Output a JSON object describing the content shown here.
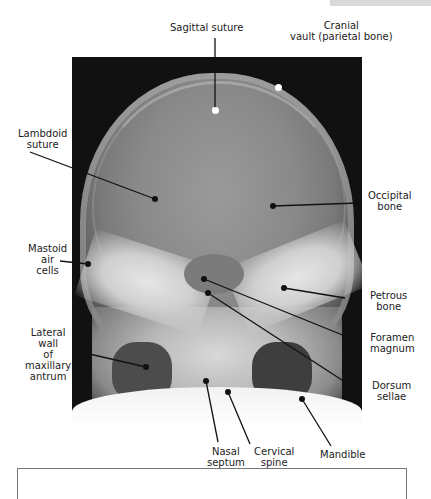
{
  "figure": {
    "header_tab_text": "",
    "labels": {
      "sagittal_suture": "Sagittal suture",
      "cranial_vault_1": "Cranial",
      "cranial_vault_2": "vault (parietal bone)",
      "lambdoid_1": "Lambdoid",
      "lambdoid_2": "suture",
      "occipital_1": "Occipital",
      "occipital_2": "bone",
      "mastoid_1": "Mastoid",
      "mastoid_2": "air",
      "mastoid_3": "cells",
      "petrous_1": "Petrous",
      "petrous_2": "bone",
      "lateral_wall_1": "Lateral",
      "lateral_wall_2": "wall",
      "lateral_wall_3": "of",
      "lateral_wall_4": "maxillary",
      "lateral_wall_5": "antrum",
      "foramen_1": "Foramen",
      "foramen_2": "magnum",
      "dorsum_1": "Dorsum",
      "dorsum_2": "sellae",
      "nasal_1": "Nasal",
      "nasal_2": "septum",
      "cervical_1": "Cervical",
      "cervical_2": "spine",
      "mandible": "Mandible"
    },
    "colors": {
      "leader_line": "#111111",
      "label_text": "#222222",
      "xray_background": "#111111"
    }
  }
}
